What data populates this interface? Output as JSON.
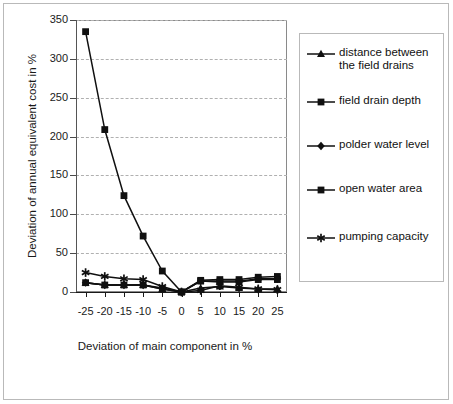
{
  "chart_data": {
    "type": "line",
    "title": "",
    "xlabel": "Deviation of main component in %",
    "ylabel": "Deviation of annual equivalent cost in %",
    "x": [
      -25,
      -20,
      -15,
      -10,
      -5,
      0,
      5,
      10,
      15,
      20,
      25
    ],
    "categories": [
      "-25",
      "-20",
      "-15",
      "-10",
      "-5",
      "0",
      "5",
      "10",
      "15",
      "20",
      "25"
    ],
    "xlim": [
      -27.5,
      27.5
    ],
    "ylim": [
      0,
      350
    ],
    "yticks": [
      0,
      50,
      100,
      150,
      200,
      250,
      300,
      350
    ],
    "ytick_labels": [
      "0",
      "50",
      "100",
      "150",
      "200",
      "250",
      "300",
      "350"
    ],
    "grid": "horizontal-dashed",
    "legend_position": "right",
    "series": [
      {
        "name": "distance between\nthe field drains",
        "marker": "triangle",
        "values": [
          12,
          9,
          9,
          9,
          4,
          0,
          5,
          7,
          5,
          4,
          4
        ]
      },
      {
        "name": "field drain depth",
        "marker": "square",
        "values": [
          335,
          209,
          124,
          72,
          27,
          0,
          15,
          16,
          16,
          19,
          20
        ]
      },
      {
        "name": "polder water level",
        "marker": "diamond",
        "values": [
          12,
          9,
          9,
          9,
          5,
          0,
          14,
          14,
          14,
          17,
          17
        ]
      },
      {
        "name": "open water area",
        "marker": "square",
        "values": [
          12,
          9,
          9,
          9,
          4,
          0,
          14,
          13,
          13,
          16,
          16
        ]
      },
      {
        "name": "pumping capacity",
        "marker": "asterisk",
        "values": [
          25,
          20,
          17,
          16,
          7,
          0,
          2,
          8,
          6,
          4,
          3
        ]
      }
    ]
  },
  "axes": {
    "y_title": "Deviation of annual equivalent cost in %",
    "x_title": "Deviation of main component in %",
    "y_tick_labels": [
      "350",
      "300",
      "250",
      "200",
      "150",
      "100",
      "50",
      "0"
    ],
    "x_tick_labels": [
      "-25",
      "-20",
      "-15",
      "-10",
      "-5",
      "0",
      "5",
      "10",
      "15",
      "20",
      "25"
    ]
  },
  "legend": {
    "items": [
      {
        "label": "distance between\nthe field drains",
        "marker": "triangle-marker"
      },
      {
        "label": "field drain depth",
        "marker": "square-marker"
      },
      {
        "label": "polder water level",
        "marker": "diamond-marker"
      },
      {
        "label": "open water area",
        "marker": "square-marker"
      },
      {
        "label": "pumping capacity",
        "marker": "asterisk-marker"
      }
    ]
  },
  "colors": {
    "series_line": "#101010",
    "marker": "#101010",
    "grid": "#b0b0b0",
    "frame": "#8a8a8a",
    "outer_frame": "#b9b9b9",
    "text": "#1a1a1a",
    "background": "#ffffff"
  }
}
